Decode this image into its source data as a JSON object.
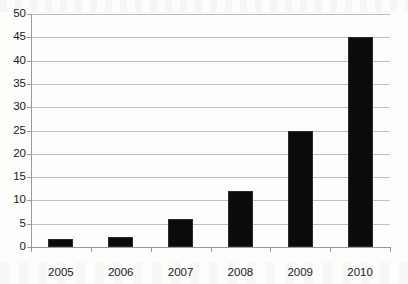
{
  "chart_data": {
    "type": "bar",
    "title": "",
    "subtitle": "",
    "xlabel": "",
    "ylabel": "",
    "categories": [
      "2005",
      "2006",
      "2007",
      "2008",
      "2009",
      "2010"
    ],
    "values": [
      1.7,
      2.2,
      6,
      12,
      25,
      45
    ],
    "series": [
      {
        "name": "",
        "values": [
          1.7,
          2.2,
          6,
          12,
          25,
          45
        ]
      }
    ],
    "ylim": [
      0,
      50
    ],
    "ytick_step": 5,
    "ytick_labels": [
      "50",
      "45",
      "40",
      "35",
      "30",
      "25",
      "20",
      "15",
      "10",
      "5",
      "0"
    ],
    "ytick_values": [
      50,
      45,
      40,
      35,
      30,
      25,
      20,
      15,
      10,
      5,
      0
    ],
    "grid": true,
    "grid_axis": "y",
    "legend": false,
    "legend_position": "none",
    "bar_color": "#0b0b0b",
    "grid_color": "#c0c0c0",
    "axis_color": "#9a9a9a",
    "background_color": "#fdfdfc",
    "annotations": []
  }
}
